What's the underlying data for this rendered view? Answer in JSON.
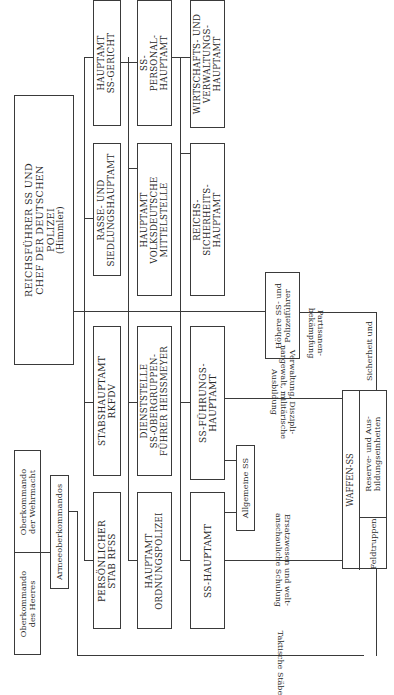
{
  "orientation": "rotated 90 degrees counter-clockwise",
  "top": {
    "name": "REICHSFÜHRER SS UND CHEF DER DEUTSCHEN POLIZEI",
    "lines": [
      "REICHSFÜHRER SS UND",
      "CHEF DER DEUTSCHEN",
      "POLIZEI",
      "(Himmler)"
    ]
  },
  "wehrmacht": {
    "okw": [
      "Oberkommando",
      "der Wehrmacht"
    ],
    "okh": [
      "Oberkommando",
      "des Heeres"
    ],
    "armee": "Armeeoberkommandos"
  },
  "offices": {
    "gericht": [
      "HAUPTAMT",
      "SS-GERICHT"
    ],
    "personal": [
      "SS-",
      "PERSONAL-",
      "HAUPTAMT"
    ],
    "wvha": [
      "WIRTSCHAFTS- UND",
      "VERWALTUNGS-",
      "HAUPTAMT"
    ],
    "rusha": [
      "RASSE- UND",
      "SIEDLUNGSHAUPTAMT"
    ],
    "vomi": [
      "HAUPTAMT",
      "VOLKSDEUTSCHE",
      "MITTELSTELLE"
    ],
    "rsha": [
      "REICHS-",
      "SICHERHEITS-",
      "HAUPTAMT"
    ],
    "rkfdv": [
      "STABSHAUPTAMT",
      "RKFDV"
    ],
    "heissmeyer": [
      "DIENSTSTELLE",
      "SS-OBERGRUPPEN-",
      "FÜHRER HEISSMEYER"
    ],
    "fha": [
      "SS-FÜHRUNGS-",
      "HAUPTAMT"
    ],
    "persstab": [
      "PERSÖNLICHER",
      "STAB RFSS"
    ],
    "orpo": [
      "HAUPTAMT",
      "ORDNUNGSPOLIZEI"
    ],
    "ssha": [
      "SS-HAUPTAMT"
    ]
  },
  "units": {
    "allgemeine": "Allgemeine SS",
    "hspf": [
      "Höhere SS- und",
      "Polizeiführer"
    ],
    "waffen": "WAFFEN-SS",
    "reserve": [
      "Reserve- und Aus-",
      "bildungseinheiten"
    ],
    "feld": "Feldtruppen"
  },
  "edge_labels": {
    "partisan": [
      "Partisanen-",
      "bekämpfung"
    ],
    "sicherheit": "Sicherheit und",
    "verwaltung": [
      "Verwaltung, Diszipli-",
      "nargewalt, militärische",
      "Ausbildung"
    ],
    "ersatz": [
      "Ersatzwesen und welt-",
      "anschauliche Schulung"
    ],
    "taktisch": "Taktische Stäbe"
  }
}
